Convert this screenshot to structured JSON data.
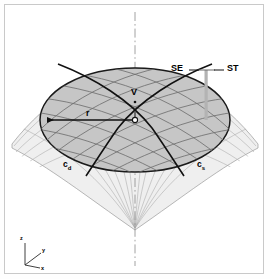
{
  "figure": {
    "background_color": "#ffffff",
    "frame_color": "#c9c9c9"
  },
  "labels": {
    "se": "SE",
    "st": "ST",
    "vertex": "V",
    "radius": "r",
    "curve_dip": "c",
    "curve_dip_sub": "d",
    "curve_strike": "c",
    "curve_strike_sub": "s"
  },
  "axes": {
    "z": "z",
    "y": "y",
    "x": "x"
  },
  "colors": {
    "cap_fill": "#c4c4c4",
    "outer_fill": "#ededed",
    "grid_line": "#6e6e6e",
    "outline": "#1a1a1a",
    "bar": "#b0b0b0",
    "centerline": "#8c8c8c"
  },
  "annotations": {
    "se_st_bar": "vertical measure bar between SE and ST",
    "radius_arrow": "leftward arrow from center to cap edge",
    "symmetry_axis": "vertical dash-dot centerline"
  }
}
